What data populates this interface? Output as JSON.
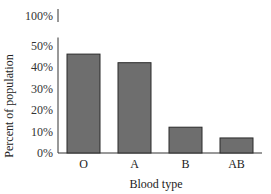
{
  "chart_data": {
    "type": "bar",
    "title": "",
    "xlabel": "Blood type",
    "ylabel": "Percent of population",
    "categories": [
      "O",
      "A",
      "B",
      "AB"
    ],
    "values": [
      46,
      42,
      12,
      7
    ],
    "ylim": [
      0,
      100
    ],
    "axis_break": [
      50,
      100
    ],
    "yticks": [
      0,
      10,
      20,
      30,
      40,
      50,
      100
    ],
    "ytick_labels": [
      "0%",
      "10%",
      "20%",
      "30%",
      "40%",
      "50%",
      "100%"
    ],
    "grid": false,
    "legend": "none"
  }
}
